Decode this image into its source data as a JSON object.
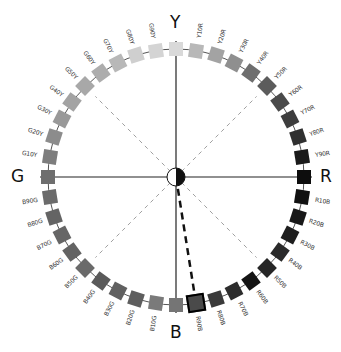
{
  "axes": {
    "top": "Y",
    "right": "R",
    "bottom": "B",
    "left": "G"
  },
  "center": {
    "x": 176,
    "y": 177,
    "ring_radius": 128
  },
  "highlighted_hue": "R90B",
  "hues": [
    {
      "label": "Y",
      "angle": 0,
      "color": "#d9d9d9"
    },
    {
      "label": "Y10R",
      "angle": 9,
      "color": "#b8b8b8"
    },
    {
      "label": "Y20R",
      "angle": 18,
      "color": "#a3a3a3"
    },
    {
      "label": "Y30R",
      "angle": 27,
      "color": "#8f8f8f"
    },
    {
      "label": "Y40R",
      "angle": 36,
      "color": "#6e6e6e"
    },
    {
      "label": "Y50R",
      "angle": 45,
      "color": "#5c5c5c"
    },
    {
      "label": "Y60R",
      "angle": 54,
      "color": "#4a4a4a"
    },
    {
      "label": "Y70R",
      "angle": 63,
      "color": "#3d3d3d"
    },
    {
      "label": "Y80R",
      "angle": 72,
      "color": "#303030"
    },
    {
      "label": "Y90R",
      "angle": 81,
      "color": "#1a1a1a"
    },
    {
      "label": "R",
      "angle": 90,
      "color": "#0d0d0d"
    },
    {
      "label": "R10B",
      "angle": 99,
      "color": "#111111"
    },
    {
      "label": "R20B",
      "angle": 108,
      "color": "#181818"
    },
    {
      "label": "R30B",
      "angle": 117,
      "color": "#1e1e1e"
    },
    {
      "label": "R40B",
      "angle": 126,
      "color": "#2a2a2a"
    },
    {
      "label": "R50B",
      "angle": 135,
      "color": "#262626"
    },
    {
      "label": "R60B",
      "angle": 144,
      "color": "#141414"
    },
    {
      "label": "R70B",
      "angle": 153,
      "color": "#2c2c2c"
    },
    {
      "label": "R80B",
      "angle": 162,
      "color": "#3a3a3a"
    },
    {
      "label": "R90B",
      "angle": 171,
      "color": "#4a4a4a"
    },
    {
      "label": "B",
      "angle": 180,
      "color": "#757575"
    },
    {
      "label": "B10G",
      "angle": 189,
      "color": "#7a7a7a"
    },
    {
      "label": "B20G",
      "angle": 198,
      "color": "#5e5e5e"
    },
    {
      "label": "B30G",
      "angle": 207,
      "color": "#606060"
    },
    {
      "label": "B40G",
      "angle": 216,
      "color": "#5a5a5a"
    },
    {
      "label": "B50G",
      "angle": 225,
      "color": "#6a6a6a"
    },
    {
      "label": "B60G",
      "angle": 234,
      "color": "#636363"
    },
    {
      "label": "B70G",
      "angle": 243,
      "color": "#666666"
    },
    {
      "label": "B80G",
      "angle": 252,
      "color": "#646464"
    },
    {
      "label": "B90G",
      "angle": 261,
      "color": "#6b6b6b"
    },
    {
      "label": "G",
      "angle": 270,
      "color": "#6e6e6e"
    },
    {
      "label": "G10Y",
      "angle": 279,
      "color": "#7d7d7d"
    },
    {
      "label": "G20Y",
      "angle": 288,
      "color": "#8c8c8c"
    },
    {
      "label": "G30Y",
      "angle": 297,
      "color": "#999999"
    },
    {
      "label": "G40Y",
      "angle": 306,
      "color": "#a3a3a3"
    },
    {
      "label": "G50Y",
      "angle": 315,
      "color": "#a8a8a8"
    },
    {
      "label": "G60Y",
      "angle": 324,
      "color": "#adadad"
    },
    {
      "label": "G70Y",
      "angle": 333,
      "color": "#b8b8b8"
    },
    {
      "label": "G80Y",
      "angle": 342,
      "color": "#cfcfcf"
    },
    {
      "label": "G90Y",
      "angle": 351,
      "color": "#d4d4d4"
    }
  ]
}
